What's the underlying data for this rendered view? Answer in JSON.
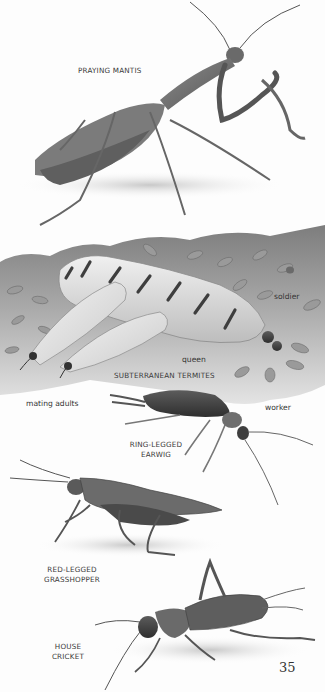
{
  "page": {
    "page_number": "35",
    "colors": {
      "background": "#fdfdfd",
      "ink": "#3a3a3a",
      "soil": "#8a8a8a",
      "insect_dark": "#3c3c3c",
      "insect_mid": "#7a7a7a",
      "queen_body": "#d9d9d9"
    }
  },
  "illustrations": [
    {
      "id": "praying-mantis",
      "label": "PRAYING MANTIS"
    },
    {
      "id": "subterranean-termites",
      "label": "SUBTERRANEAN TERMITES",
      "annotations": {
        "soldier": "soldier",
        "queen": "queen",
        "mating_adults": "mating adults",
        "worker": "worker"
      }
    },
    {
      "id": "ring-legged-earwig",
      "label_line1": "RING-LEGGED",
      "label_line2": "EARWIG"
    },
    {
      "id": "red-legged-grasshopper",
      "label_line1": "RED-LEGGED",
      "label_line2": "GRASSHOPPER"
    },
    {
      "id": "house-cricket",
      "label_line1": "HOUSE",
      "label_line2": "CRICKET"
    }
  ]
}
